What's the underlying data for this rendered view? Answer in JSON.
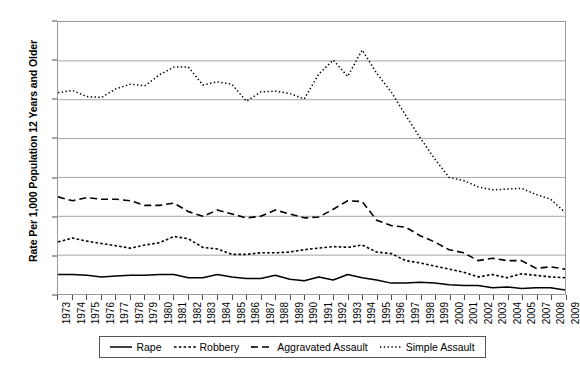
{
  "chart_data": {
    "type": "line",
    "title": "",
    "xlabel": "",
    "ylabel": "Rate Per 1,000 Population 12 Years and Older",
    "ylim": [
      0,
      35
    ],
    "yticks": [
      0,
      5,
      10,
      15,
      20,
      25,
      30,
      35
    ],
    "grid": "horizontal",
    "legend_position": "bottom",
    "categories": [
      "1973",
      "1974",
      "1975",
      "1976",
      "1977",
      "1978",
      "1979",
      "1980",
      "1981",
      "1982",
      "1983",
      "1984",
      "1985",
      "1986",
      "1987",
      "1988",
      "1989",
      "1990",
      "1991",
      "1992",
      "1993",
      "1994",
      "1995",
      "1996",
      "1997",
      "1998",
      "1999",
      "2000",
      "2001",
      "2002",
      "2003",
      "2004",
      "2005",
      "2007",
      "2008",
      "2009"
    ],
    "series": [
      {
        "name": "Rape",
        "style": "solid",
        "color": "#000000",
        "values": [
          2.5,
          2.5,
          2.4,
          2.2,
          2.3,
          2.4,
          2.4,
          2.5,
          2.5,
          2.1,
          2.1,
          2.5,
          2.2,
          2.0,
          2.0,
          2.4,
          1.9,
          1.7,
          2.2,
          1.8,
          2.5,
          2.1,
          1.8,
          1.4,
          1.4,
          1.5,
          1.4,
          1.2,
          1.1,
          1.1,
          0.8,
          0.9,
          0.7,
          0.8,
          0.8,
          0.5
        ]
      },
      {
        "name": "Robbery",
        "style": "dotted-small",
        "color": "#000000",
        "values": [
          6.7,
          7.2,
          6.8,
          6.5,
          6.2,
          5.9,
          6.3,
          6.6,
          7.4,
          7.1,
          6.0,
          5.8,
          5.1,
          5.1,
          5.3,
          5.3,
          5.4,
          5.7,
          5.9,
          6.1,
          6.0,
          6.3,
          5.4,
          5.2,
          4.3,
          4.0,
          3.6,
          3.2,
          2.8,
          2.2,
          2.5,
          2.1,
          2.6,
          2.4,
          2.2,
          2.1
        ]
      },
      {
        "name": "Aggravated Assault",
        "style": "dashed-long",
        "color": "#000000",
        "values": [
          12.5,
          12.0,
          12.4,
          12.2,
          12.2,
          12.0,
          11.4,
          11.4,
          11.7,
          10.6,
          10.0,
          10.8,
          10.3,
          9.8,
          10.0,
          10.8,
          10.3,
          9.8,
          9.9,
          10.9,
          12.0,
          11.9,
          9.5,
          8.8,
          8.6,
          7.5,
          6.7,
          5.7,
          5.3,
          4.3,
          4.6,
          4.3,
          4.3,
          3.3,
          3.5,
          3.2
        ]
      },
      {
        "name": "Simple Assault",
        "style": "dotted",
        "color": "#000000",
        "values": [
          25.9,
          26.2,
          25.4,
          25.3,
          26.4,
          27.0,
          26.8,
          28.2,
          29.2,
          29.2,
          26.9,
          27.3,
          27.0,
          24.8,
          26.0,
          26.1,
          25.8,
          25.1,
          28.3,
          30.1,
          28.0,
          31.4,
          28.4,
          26.0,
          23.0,
          20.1,
          17.4,
          15.0,
          14.6,
          13.8,
          13.4,
          13.5,
          13.6,
          12.8,
          12.2,
          10.5
        ]
      }
    ]
  },
  "legend": {
    "entries": [
      {
        "label": "Rape",
        "style": "solid"
      },
      {
        "label": "Robbery",
        "style": "dotted-small"
      },
      {
        "label": "Aggravated Assault",
        "style": "dashed-long"
      },
      {
        "label": "Simple Assault",
        "style": "dotted"
      }
    ]
  }
}
